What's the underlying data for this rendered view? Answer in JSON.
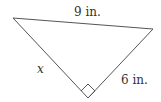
{
  "diagram": {
    "type": "right-triangle",
    "labels": {
      "hypotenuse": "9 in.",
      "left_leg": "x",
      "right_leg": "6 in."
    },
    "right_angle_marker": true,
    "colors": {
      "stroke": "#555555",
      "text": "#333333",
      "background": "#ffffff"
    }
  }
}
